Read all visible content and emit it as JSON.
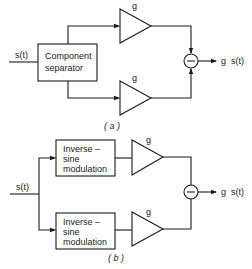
{
  "panel_a": {
    "input_label": "s(t)",
    "separator_box": {
      "line1": "Component",
      "line2": "separator"
    },
    "amp_top_gain": "g",
    "amp_bottom_gain": "g",
    "summer_sign": "−",
    "output_label": "g  s(t)",
    "caption": "( a )"
  },
  "panel_b": {
    "input_label": "s(t)",
    "mod_box_top": {
      "line1": "Inverse –",
      "line2": "sine",
      "line3": "modulation"
    },
    "mod_box_bottom": {
      "line1": "Inverse –",
      "line2": "sine",
      "line3": "modulation"
    },
    "amp_top_gain": "g",
    "amp_bottom_gain": "g",
    "summer_sign": "−",
    "output_label": "g  s(t)",
    "caption": "( b )"
  },
  "colors": {
    "ink": "#1a1a1a",
    "background": "#ffffff"
  }
}
